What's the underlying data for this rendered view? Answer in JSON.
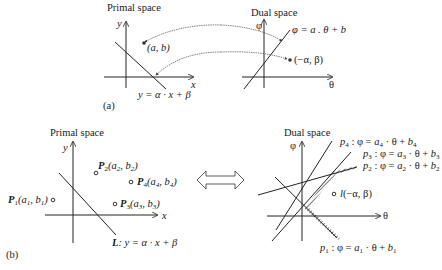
{
  "panel_a": {
    "caption": "(a)",
    "primal": {
      "title": "Primal space",
      "x_axis": "x",
      "y_axis": "y",
      "point_label": "(a, b)",
      "line_label": "y = α · x + β"
    },
    "dual": {
      "title": "Dual space",
      "x_axis": "θ",
      "y_axis": "φ",
      "line_label": "φ = a . θ + b",
      "point_label": "(−α, β)"
    }
  },
  "panel_b": {
    "caption": "(b)",
    "primal": {
      "title": "Primal space",
      "x_axis": "x",
      "y_axis": "y",
      "points": [
        {
          "name": "P",
          "sub": "1",
          "coords": "(a₁, b₁)"
        },
        {
          "name": "P",
          "sub": "2",
          "coords": "(a₂, b₂)"
        },
        {
          "name": "P",
          "sub": "3",
          "coords": "(a₃, b₃)"
        },
        {
          "name": "P",
          "sub": "4",
          "coords": "(a₄, b₄)"
        }
      ],
      "line_label": "L: y = α · x + β"
    },
    "dual": {
      "title": "Dual space",
      "x_axis": "θ",
      "y_axis": "φ",
      "lines": [
        {
          "label": "p₄ : φ = a₄ · θ + b₄"
        },
        {
          "label": "p₃ : φ = a₃ · θ + b₃"
        },
        {
          "label": "p₂ : φ = a₂ · θ + b₂"
        },
        {
          "label": "p₁ : φ = a₁ · θ + b₁"
        }
      ],
      "point_label": "l(−α, β)"
    },
    "arrow": "double-arrow"
  }
}
